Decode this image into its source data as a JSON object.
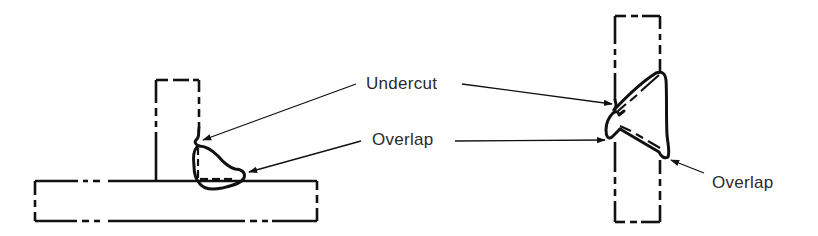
{
  "figure": {
    "type": "weld-defects-illustration",
    "colors": {
      "ink": "#111111",
      "label": "#2a2a2a",
      "background": "#ffffff"
    },
    "left_joint": {
      "name": "fillet weld on T-joint",
      "labels": []
    },
    "right_joint": {
      "name": "groove weld on butt joint"
    },
    "labels": {
      "undercut": "Undercut",
      "overlap_center": "Overlap",
      "overlap_right": "Overlap"
    },
    "callouts": [
      {
        "label": "Undercut",
        "targets": [
          "left-weld-toe-upper",
          "right-weld-toe-upper"
        ]
      },
      {
        "label": "Overlap",
        "targets": [
          "left-weld-toe-lower",
          "right-weld-toe-left"
        ]
      },
      {
        "label": "Overlap",
        "targets": [
          "right-weld-root-toe"
        ]
      }
    ]
  }
}
